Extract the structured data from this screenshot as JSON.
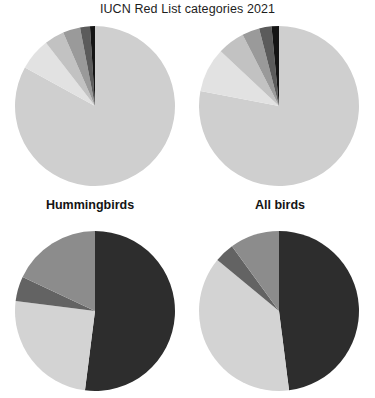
{
  "figure": {
    "title": "IUCN Red List categories 2021",
    "group_labels": {
      "left": "Hummingbirds",
      "right": "All birds"
    }
  },
  "palette": {
    "background": "#ffffff",
    "least_concern": "#cfcfcf",
    "near_threatened": "#e2e2e2",
    "vulnerable": "#c2c2c2",
    "endangered": "#9a9a9a",
    "critically_endangered": "#5b5b5b",
    "extinct": "#141414",
    "decreasing": "#2d2d2d",
    "stable": "#d3d3d3",
    "increasing": "#8c8c8c",
    "unknown": "#636363",
    "title_color": "#1d1d1d",
    "label_color": "#141414"
  },
  "chart_data": [
    {
      "id": "hummingbirds-redlist",
      "type": "pie",
      "title": "Hummingbirds",
      "row": "IUCN Red List categories 2021",
      "position": "top-left",
      "start_angle": -90,
      "direction": "clockwise",
      "labels": [
        "Least Concern",
        "Near Threatened",
        "Vulnerable",
        "Endangered",
        "Critically Endangered",
        "Extinct"
      ],
      "values": [
        83.0,
        6.5,
        4.0,
        3.5,
        2.0,
        1.0
      ],
      "colors": [
        "#cfcfcf",
        "#e2e2e2",
        "#c2c2c2",
        "#9a9a9a",
        "#5b5b5b",
        "#141414"
      ],
      "units": "percent"
    },
    {
      "id": "allbirds-redlist",
      "type": "pie",
      "title": "All birds",
      "row": "IUCN Red List categories 2021",
      "position": "top-right",
      "start_angle": -90,
      "direction": "clockwise",
      "labels": [
        "Least Concern",
        "Near Threatened",
        "Vulnerable",
        "Endangered",
        "Critically Endangered",
        "Extinct"
      ],
      "values": [
        78.0,
        9.0,
        5.5,
        3.5,
        2.5,
        1.5
      ],
      "colors": [
        "#cfcfcf",
        "#e2e2e2",
        "#c2c2c2",
        "#9a9a9a",
        "#5b5b5b",
        "#141414"
      ],
      "units": "percent"
    },
    {
      "id": "hummingbirds-trend",
      "type": "pie",
      "title": "Hummingbirds",
      "row": "Population trend",
      "position": "bottom-left",
      "start_angle": -90,
      "direction": "clockwise",
      "labels": [
        "Decreasing",
        "Stable",
        "Unknown",
        "Increasing"
      ],
      "values": [
        52.0,
        25.0,
        5.0,
        18.0
      ],
      "colors": [
        "#2d2d2d",
        "#d3d3d3",
        "#636363",
        "#8c8c8c"
      ],
      "units": "percent"
    },
    {
      "id": "allbirds-trend",
      "type": "pie",
      "title": "All birds",
      "row": "Population trend",
      "position": "bottom-right",
      "start_angle": -90,
      "direction": "clockwise",
      "labels": [
        "Decreasing",
        "Stable",
        "Unknown",
        "Increasing"
      ],
      "values": [
        48.0,
        38.0,
        4.0,
        10.0
      ],
      "colors": [
        "#2d2d2d",
        "#d3d3d3",
        "#636363",
        "#8c8c8c"
      ],
      "units": "percent"
    }
  ]
}
